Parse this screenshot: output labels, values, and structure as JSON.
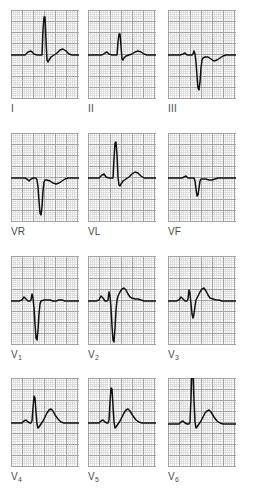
{
  "figure": {
    "title": "",
    "paper_color": "#ffffff",
    "grid_fine_color": "#c9c9c9",
    "grid_bold_color": "#9a9a9a",
    "trace_color": "#111111",
    "label_color": "#4a4a4a"
  },
  "chart_data": {
    "type": "line",
    "xlabel": "Time",
    "ylabel": "Voltage",
    "grid": true,
    "legend": "none",
    "axis_units": {
      "x": "25 mm/s (1 small square = 0.04 s)",
      "y": "10 mm/mV (1 small square = 0.1 mV)"
    },
    "panel_grid": {
      "small_square_px": 2.2,
      "bold_every": 5,
      "panel_width_px": 68,
      "panel_height_px": 89,
      "baseline_y_px": 45
    },
    "layout": {
      "rows": 4,
      "cols": 3
    },
    "series": [
      {
        "name": "I",
        "label": "I",
        "row": 0,
        "col": 0,
        "features": {
          "p_wave": "small upright",
          "qrs": "tall R",
          "t_wave": "upright"
        },
        "amplitudes_mv": {
          "p": 0.12,
          "q": -0.05,
          "r": 1.55,
          "s": -0.08,
          "t": 0.22
        },
        "points": "0,45 10,45 14,45 17,42 20,41 23,44 26,45 30,45 31,45 32,20 33,7 34,7 35,30 36,50 37,52 38,50 40,47 43,45 46,43 49,40 52,39 55,41 58,44 61,45 68,45"
      },
      {
        "name": "II",
        "label": "II",
        "row": 0,
        "col": 1,
        "features": {
          "p_wave": "small upright",
          "qrs": "modest R",
          "t_wave": "low upright"
        },
        "amplitudes_mv": {
          "p": 0.1,
          "q": -0.05,
          "r": 0.75,
          "s": -0.06,
          "t": 0.12
        },
        "points": "0,45 10,45 14,45 17,43 19,42 21,44 24,45 28,45 29,45 30,32 31,24 32,24 33,36 34,49 35,50 36,48 38,46 41,45 44,44 47,42 50,41 53,42 56,44 59,45 68,45"
      },
      {
        "name": "III",
        "label": "III",
        "row": 0,
        "col": 2,
        "features": {
          "p_wave": "small",
          "qrs": "deep QS",
          "t_wave": "shallow inverted"
        },
        "amplitudes_mv": {
          "p": 0.05,
          "q": -1.35,
          "r": 0.1,
          "s": -1.35,
          "t": -0.12
        },
        "points": "0,45 8,45 12,45 15,44 17,43 19,45 22,45 24,45 25,44 26,41 27,44 28,52 29,66 30,78 31,80 32,72 33,58 34,50 35,48 37,47 40,47 43,49 46,51 49,50 52,48 55,46 58,45 68,45"
      },
      {
        "name": "VR",
        "label": "VR",
        "row": 1,
        "col": 0,
        "features": {
          "p_wave": "small inverted",
          "qrs": "deep negative",
          "t_wave": "flat"
        },
        "amplitudes_mv": {
          "p": -0.06,
          "q": -1.45,
          "r": 0.05,
          "s": -1.45,
          "t": -0.05
        },
        "points": "0,45 10,45 14,45 16,46 18,48 20,46 22,45 24,45 25,45 26,47 27,54 28,68 29,80 30,82 31,74 32,58 33,49 34,47 36,47 39,48 42,50 45,51 48,50 51,48 54,46 57,45 68,45"
      },
      {
        "name": "VL",
        "label": "VL",
        "row": 1,
        "col": 1,
        "features": {
          "p_wave": "small upright",
          "qrs": "tall R",
          "t_wave": "upright"
        },
        "amplitudes_mv": {
          "p": 0.1,
          "q": -0.05,
          "r": 1.7,
          "s": -0.1,
          "t": 0.25
        },
        "points": "0,45 8,45 11,45 14,42 16,41 18,44 21,45 24,45 25,45 26,26 27,10 28,9 29,22 30,44 31,52 32,53 33,51 35,48 38,46 41,44 44,41 47,39 50,40 53,43 56,45 59,45 68,45"
      },
      {
        "name": "VF",
        "label": "VF",
        "row": 1,
        "col": 2,
        "features": {
          "p_wave": "small",
          "qrs": "negative qs",
          "t_wave": "flat"
        },
        "amplitudes_mv": {
          "p": 0.05,
          "q": -0.75,
          "r": 0.08,
          "s": -0.75,
          "t": 0.04
        },
        "points": "0,45 10,45 14,45 16,44 18,43 20,45 23,45 25,45 26,45 27,48 28,56 29,63 30,62 31,55 32,48 33,46 35,46 38,46 41,47 44,47 47,46 50,45 53,45 56,45 68,45"
      },
      {
        "name": "V1",
        "label": "V",
        "sublabel": "1",
        "row": 2,
        "col": 0,
        "features": {
          "p_wave": "biphasic",
          "qrs": "rS deep S",
          "t_wave": "flat"
        },
        "amplitudes_mv": {
          "p": 0.12,
          "q": 0.0,
          "r": 0.3,
          "s": -1.55,
          "t": 0.04
        },
        "points": "0,45 8,45 11,44 13,41 15,43 17,45 19,45 20,44 21,38 22,42 23,52 24,68 25,82 26,84 27,74 28,58 29,48 30,45 33,44 36,44 39,44 42,45 45,45 48,44 51,44 54,45 57,45 68,45"
      },
      {
        "name": "V2",
        "label": "V",
        "sublabel": "2",
        "row": 2,
        "col": 1,
        "features": {
          "p_wave": "small upright",
          "qrs": "rS deep S",
          "t_wave": "upright"
        },
        "amplitudes_mv": {
          "p": 0.12,
          "q": 0.0,
          "r": 0.35,
          "s": -1.7,
          "t": 0.3
        },
        "points": "0,45 8,45 11,44 13,40 15,42 17,45 19,45 20,44 21,36 22,40 23,52 24,70 25,84 26,86 27,72 28,54 29,44 30,40 32,36 34,33 36,32 38,34 40,38 42,41 44,42 47,43 50,43 53,44 56,45 68,45"
      },
      {
        "name": "V3",
        "label": "V",
        "sublabel": "3",
        "row": 2,
        "col": 2,
        "features": {
          "p_wave": "small upright",
          "qrs": "rS",
          "t_wave": "upright"
        },
        "amplitudes_mv": {
          "p": 0.12,
          "q": 0.0,
          "r": 0.45,
          "s": -0.85,
          "t": 0.35
        },
        "points": "0,45 8,45 11,44 13,41 15,43 17,45 19,45 20,43 21,34 22,38 23,48 24,58 25,62 26,58 27,50 28,44 30,40 32,36 34,33 36,32 38,35 40,39 42,42 45,43 48,44 51,44 54,45 68,45"
      },
      {
        "name": "V4",
        "label": "V",
        "sublabel": "4",
        "row": 3,
        "col": 0,
        "features": {
          "p_wave": "small upright",
          "qrs": "R wave",
          "t_wave": "broad upright"
        },
        "amplitudes_mv": {
          "p": 0.1,
          "q": -0.1,
          "r": 1.15,
          "s": -0.12,
          "t": 0.4
        },
        "points": "0,45 8,45 11,45 13,43 15,42 17,44 19,45 20,45 21,43 22,30 23,18 24,20 25,34 26,46 27,50 28,49 30,46 32,43 34,39 36,35 38,32 40,31 42,33 44,37 47,41 50,44 53,45 56,45 68,45"
      },
      {
        "name": "V5",
        "label": "V",
        "sublabel": "5",
        "row": 3,
        "col": 1,
        "features": {
          "p_wave": "small upright",
          "qrs": "tall R",
          "t_wave": "broad upright"
        },
        "amplitudes_mv": {
          "p": 0.1,
          "q": -0.1,
          "r": 1.6,
          "s": -0.12,
          "t": 0.4
        },
        "points": "0,45 8,45 11,45 13,43 15,42 17,44 19,45 20,45 21,42 22,24 23,10 24,11 25,28 26,44 27,50 28,49 30,46 32,43 34,39 36,35 38,32 40,31 42,33 45,38 48,42 51,44 54,45 68,45"
      },
      {
        "name": "V6",
        "label": "V",
        "sublabel": "6",
        "row": 3,
        "col": 2,
        "features": {
          "p_wave": "small upright",
          "qrs": "very tall R clipped",
          "t_wave": "broad upright"
        },
        "amplitudes_mv": {
          "p": 0.1,
          "q": -0.1,
          "r": 2.1,
          "s": -0.12,
          "t": 0.4
        },
        "points": "0,46 8,46 11,46 13,44 15,43 17,45 19,46 21,46 22,44 23,20 24,-10 25,-10 26,22 27,44 28,50 29,49 31,46 33,43 35,39 37,35 39,33 41,32 43,34 46,39 49,43 52,45 55,46 68,46"
      }
    ]
  },
  "leads": [
    {
      "id": "I",
      "label": "I",
      "sublabel": ""
    },
    {
      "id": "II",
      "label": "II",
      "sublabel": ""
    },
    {
      "id": "III",
      "label": "III",
      "sublabel": ""
    },
    {
      "id": "VR",
      "label": "VR",
      "sublabel": ""
    },
    {
      "id": "VL",
      "label": "VL",
      "sublabel": ""
    },
    {
      "id": "VF",
      "label": "VF",
      "sublabel": ""
    },
    {
      "id": "V1",
      "label": "V",
      "sublabel": "1"
    },
    {
      "id": "V2",
      "label": "V",
      "sublabel": "2"
    },
    {
      "id": "V3",
      "label": "V",
      "sublabel": "3"
    },
    {
      "id": "V4",
      "label": "V",
      "sublabel": "4"
    },
    {
      "id": "V5",
      "label": "V",
      "sublabel": "5"
    },
    {
      "id": "V6",
      "label": "V",
      "sublabel": "6"
    }
  ]
}
